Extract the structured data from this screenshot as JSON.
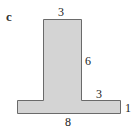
{
  "figure": {
    "part_label": "c",
    "shape": "T-shape",
    "fill_color": "#d4d4d4",
    "stroke_color": "#555555",
    "labels": {
      "stem_top_width": "3",
      "stem_height": "6",
      "base_right_overhang": "3",
      "base_height": "1",
      "base_width": "8"
    }
  }
}
